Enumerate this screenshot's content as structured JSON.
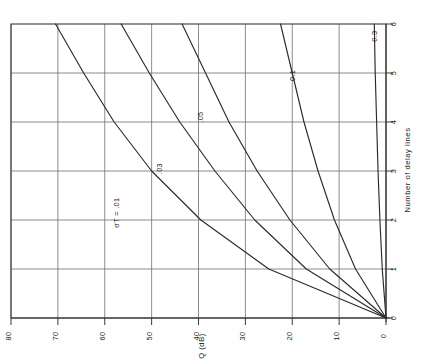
{
  "chart_data": {
    "type": "line",
    "title": "",
    "orientation": "rotated-90-ccw",
    "xlabel": "Number of delay lines",
    "ylabel": "Q (dB)",
    "xlim": [
      0,
      6
    ],
    "ylim": [
      0,
      80
    ],
    "xticks": [
      "0",
      "1",
      "2",
      "3",
      "4",
      "5",
      "6"
    ],
    "yticks": [
      "0",
      "10",
      "20",
      "30",
      "40",
      "50",
      "60",
      "70",
      "80"
    ],
    "grid": true,
    "legend": "inline-curve-labels",
    "x": [
      0,
      1,
      2,
      3,
      4,
      5,
      6
    ],
    "series": [
      {
        "name": "sigma-T = .01",
        "label": "σT = .01",
        "label_x": 2.15,
        "label_y": 57.0,
        "values": [
          0,
          25.0,
          39.5,
          50.0,
          58.0,
          64.5,
          70.5
        ]
      },
      {
        "name": "sigma-T = .03",
        "label": ".03",
        "label_x": 3.05,
        "label_y": 47.8,
        "values": [
          0,
          17.0,
          28.0,
          36.5,
          44.0,
          50.5,
          56.5
        ]
      },
      {
        "name": "sigma-T = .05",
        "label": ".05",
        "label_x": 4.1,
        "label_y": 39.0,
        "values": [
          0,
          12.0,
          20.5,
          27.5,
          33.5,
          38.5,
          43.5
        ]
      },
      {
        "name": "sigma-T = 0.1",
        "label": "0.1",
        "label_x": 4.95,
        "label_y": 19.5,
        "values": [
          0,
          6.5,
          11.0,
          14.5,
          17.5,
          20.0,
          22.5
        ]
      },
      {
        "name": "sigma-T = 0.3",
        "label": "0.3",
        "label_x": 5.75,
        "label_y": 2.0,
        "values": [
          0,
          0.8,
          1.3,
          1.7,
          2.0,
          2.3,
          2.5
        ]
      }
    ]
  },
  "axes": {
    "x_title": "Number of delay lines",
    "y_title": "Q (dB)"
  }
}
